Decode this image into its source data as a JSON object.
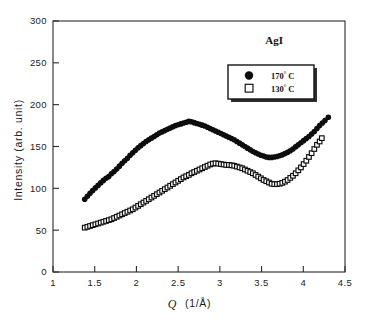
{
  "figure": {
    "name": "agi-intensity-scattering-plot",
    "background_color": "#ffffff",
    "foreground_color": "#1a1a1a"
  },
  "chart_data": {
    "type": "scatter",
    "title": "",
    "subtitle": "",
    "xlabel": "Q  (1/Å)",
    "xlabel_symbol": "Q",
    "xlabel_units": "(1/Å)",
    "ylabel": "Intensity (arb. unit)",
    "xlim": [
      1,
      4.5
    ],
    "ylim": [
      0,
      300
    ],
    "xticks": [
      1,
      1.5,
      2,
      2.5,
      3,
      3.5,
      4,
      4.5
    ],
    "xtick_labels": [
      "1",
      "1.5",
      "2",
      "2.5",
      "3",
      "3.5",
      "4",
      "4.5"
    ],
    "yticks": [
      0,
      50,
      100,
      150,
      200,
      250,
      300
    ],
    "ytick_labels": [
      "0",
      "50",
      "100",
      "150",
      "200",
      "250",
      "300"
    ],
    "grid": false,
    "tick_direction": "in",
    "legend_position": "upper right",
    "annotations": [
      {
        "text": "AgI",
        "x": 3.65,
        "y": 272,
        "name": "sample-label-agi"
      }
    ],
    "series": [
      {
        "name": "170° C",
        "label_value": "170",
        "label_degree": "°",
        "label_unit": "C",
        "marker": "filled-circle",
        "marker_size": 4.6,
        "color": "#0d0d0d",
        "points": [
          [
            1.38,
            87.0
          ],
          [
            1.412,
            90.5
          ],
          [
            1.444,
            94.0
          ],
          [
            1.476,
            97.5
          ],
          [
            1.508,
            100.5
          ],
          [
            1.54,
            103.5
          ],
          [
            1.572,
            106.5
          ],
          [
            1.604,
            109.5
          ],
          [
            1.636,
            112.0
          ],
          [
            1.668,
            114.0
          ],
          [
            1.7,
            117.5
          ],
          [
            1.732,
            120.0
          ],
          [
            1.764,
            123.0
          ],
          [
            1.796,
            126.5
          ],
          [
            1.828,
            130.0
          ],
          [
            1.86,
            133.0
          ],
          [
            1.892,
            136.0
          ],
          [
            1.924,
            139.5
          ],
          [
            1.956,
            142.5
          ],
          [
            1.988,
            145.5
          ],
          [
            2.02,
            148.5
          ],
          [
            2.052,
            151.0
          ],
          [
            2.084,
            153.5
          ],
          [
            2.116,
            156.0
          ],
          [
            2.148,
            158.0
          ],
          [
            2.18,
            160.0
          ],
          [
            2.212,
            162.0
          ],
          [
            2.244,
            164.0
          ],
          [
            2.276,
            166.0
          ],
          [
            2.308,
            167.5
          ],
          [
            2.34,
            169.0
          ],
          [
            2.372,
            170.5
          ],
          [
            2.404,
            172.0
          ],
          [
            2.436,
            173.5
          ],
          [
            2.468,
            175.0
          ],
          [
            2.5,
            176.0
          ],
          [
            2.532,
            177.0
          ],
          [
            2.564,
            178.0
          ],
          [
            2.596,
            179.0
          ],
          [
            2.628,
            180.0
          ],
          [
            2.66,
            179.5
          ],
          [
            2.692,
            178.5
          ],
          [
            2.724,
            177.5
          ],
          [
            2.756,
            176.5
          ],
          [
            2.788,
            175.5
          ],
          [
            2.82,
            174.5
          ],
          [
            2.852,
            173.0
          ],
          [
            2.884,
            171.5
          ],
          [
            2.916,
            170.0
          ],
          [
            2.948,
            168.5
          ],
          [
            2.98,
            167.0
          ],
          [
            3.012,
            165.5
          ],
          [
            3.044,
            164.0
          ],
          [
            3.076,
            162.5
          ],
          [
            3.108,
            161.0
          ],
          [
            3.14,
            159.5
          ],
          [
            3.172,
            158.0
          ],
          [
            3.204,
            156.0
          ],
          [
            3.236,
            154.0
          ],
          [
            3.268,
            152.0
          ],
          [
            3.3,
            150.0
          ],
          [
            3.332,
            148.0
          ],
          [
            3.364,
            146.0
          ],
          [
            3.396,
            144.0
          ],
          [
            3.428,
            142.5
          ],
          [
            3.46,
            141.0
          ],
          [
            3.492,
            139.5
          ],
          [
            3.524,
            138.5
          ],
          [
            3.556,
            137.5
          ],
          [
            3.588,
            137.0
          ],
          [
            3.62,
            137.0
          ],
          [
            3.652,
            137.5
          ],
          [
            3.684,
            138.0
          ],
          [
            3.716,
            139.0
          ],
          [
            3.748,
            140.0
          ],
          [
            3.78,
            141.5
          ],
          [
            3.812,
            143.0
          ],
          [
            3.844,
            145.0
          ],
          [
            3.876,
            147.0
          ],
          [
            3.908,
            149.5
          ],
          [
            3.94,
            152.0
          ],
          [
            3.972,
            154.5
          ],
          [
            4.004,
            157.0
          ],
          [
            4.036,
            159.5
          ],
          [
            4.068,
            162.0
          ],
          [
            4.1,
            165.0
          ],
          [
            4.132,
            168.0
          ],
          [
            4.164,
            171.5
          ],
          [
            4.196,
            175.0
          ],
          [
            4.228,
            178.0
          ],
          [
            4.26,
            181.0
          ],
          [
            4.3,
            185.0
          ]
        ]
      },
      {
        "name": "130° C",
        "label_value": "130",
        "label_degree": "°",
        "label_unit": "C",
        "marker": "open-square",
        "marker_size": 4.6,
        "color": "#0d0d0d",
        "points": [
          [
            1.38,
            53.0
          ],
          [
            1.412,
            54.0
          ],
          [
            1.444,
            55.0
          ],
          [
            1.476,
            56.0
          ],
          [
            1.508,
            57.0
          ],
          [
            1.54,
            58.0
          ],
          [
            1.572,
            59.0
          ],
          [
            1.604,
            60.0
          ],
          [
            1.636,
            61.0
          ],
          [
            1.668,
            62.0
          ],
          [
            1.7,
            63.0
          ],
          [
            1.732,
            64.5
          ],
          [
            1.764,
            66.0
          ],
          [
            1.796,
            67.5
          ],
          [
            1.828,
            69.0
          ],
          [
            1.86,
            70.5
          ],
          [
            1.892,
            72.0
          ],
          [
            1.924,
            73.5
          ],
          [
            1.956,
            75.0
          ],
          [
            1.988,
            77.0
          ],
          [
            2.02,
            79.0
          ],
          [
            2.052,
            81.0
          ],
          [
            2.084,
            83.0
          ],
          [
            2.116,
            85.0
          ],
          [
            2.148,
            87.0
          ],
          [
            2.18,
            89.0
          ],
          [
            2.212,
            91.0
          ],
          [
            2.244,
            93.0
          ],
          [
            2.276,
            95.0
          ],
          [
            2.308,
            97.0
          ],
          [
            2.34,
            99.0
          ],
          [
            2.372,
            101.0
          ],
          [
            2.404,
            103.0
          ],
          [
            2.436,
            105.0
          ],
          [
            2.468,
            107.0
          ],
          [
            2.5,
            109.0
          ],
          [
            2.532,
            111.0
          ],
          [
            2.564,
            113.0
          ],
          [
            2.596,
            114.5
          ],
          [
            2.628,
            116.0
          ],
          [
            2.66,
            118.0
          ],
          [
            2.692,
            119.5
          ],
          [
            2.724,
            121.0
          ],
          [
            2.756,
            122.5
          ],
          [
            2.788,
            124.0
          ],
          [
            2.82,
            125.5
          ],
          [
            2.852,
            127.0
          ],
          [
            2.884,
            128.5
          ],
          [
            2.916,
            129.5
          ],
          [
            2.948,
            130.0
          ],
          [
            2.98,
            129.5
          ],
          [
            3.012,
            129.0
          ],
          [
            3.044,
            128.5
          ],
          [
            3.076,
            128.0
          ],
          [
            3.108,
            128.0
          ],
          [
            3.14,
            127.5
          ],
          [
            3.172,
            127.0
          ],
          [
            3.204,
            126.0
          ],
          [
            3.236,
            125.0
          ],
          [
            3.268,
            124.0
          ],
          [
            3.3,
            122.5
          ],
          [
            3.332,
            121.0
          ],
          [
            3.364,
            119.5
          ],
          [
            3.396,
            118.0
          ],
          [
            3.428,
            116.0
          ],
          [
            3.46,
            114.0
          ],
          [
            3.492,
            112.0
          ],
          [
            3.524,
            110.0
          ],
          [
            3.556,
            108.5
          ],
          [
            3.588,
            107.0
          ],
          [
            3.62,
            105.5
          ],
          [
            3.652,
            105.0
          ],
          [
            3.684,
            105.0
          ],
          [
            3.716,
            105.5
          ],
          [
            3.748,
            106.5
          ],
          [
            3.78,
            108.0
          ],
          [
            3.812,
            110.0
          ],
          [
            3.844,
            112.5
          ],
          [
            3.876,
            115.0
          ],
          [
            3.908,
            118.0
          ],
          [
            3.94,
            121.5
          ],
          [
            3.972,
            125.0
          ],
          [
            4.004,
            129.0
          ],
          [
            4.036,
            133.0
          ],
          [
            4.068,
            137.5
          ],
          [
            4.1,
            142.0
          ],
          [
            4.132,
            147.0
          ],
          [
            4.164,
            152.0
          ],
          [
            4.196,
            156.0
          ],
          [
            4.222,
            160.0
          ]
        ]
      }
    ]
  }
}
